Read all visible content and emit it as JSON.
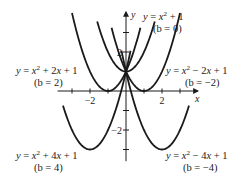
{
  "chart_data": {
    "type": "line",
    "title": "",
    "xlabel": "x",
    "ylabel": "y",
    "xlim": [
      -4,
      4
    ],
    "ylim": [
      -3.6,
      4.1
    ],
    "x_ticks": [
      -3,
      -2,
      -1,
      1,
      2,
      3
    ],
    "x_tick_labels": [
      {
        "value": -2,
        "text": "−2"
      },
      {
        "value": 2,
        "text": "2"
      }
    ],
    "y_ticks": [
      -3,
      -2,
      -1,
      1,
      2,
      3
    ],
    "y_tick_labels": [
      {
        "value": 2,
        "text": "2"
      },
      {
        "value": -2,
        "text": "−2"
      }
    ],
    "grid": false,
    "family": "y = x^2 + bx + 1",
    "series": [
      {
        "name": "y = x² + 1",
        "b": 0,
        "formula": "y = x^2 + 1",
        "label": "y = x² + 1",
        "sublabel": "(b = 0)",
        "vertex": [
          0,
          1
        ],
        "x_range": [
          -1.6,
          1.6
        ]
      },
      {
        "name": "y = x² + 2x + 1",
        "b": 2,
        "formula": "y = x^2 + 2x + 1",
        "label": "y = x² + 2x + 1",
        "sublabel": "(b = 2)",
        "vertex": [
          -1,
          0
        ],
        "x_range": [
          -3.0,
          0.8
        ]
      },
      {
        "name": "y = x² − 2x + 1",
        "b": -2,
        "formula": "y = x^2 - 2x + 1",
        "label": "y = x² − 2x + 1",
        "sublabel": "(b = −2)",
        "vertex": [
          1,
          0
        ],
        "x_range": [
          -0.8,
          3.0
        ]
      },
      {
        "name": "y = x² + 4x + 1",
        "b": 4,
        "formula": "y = x^2 + 4x + 1",
        "label": "y = x² + 4x + 1",
        "sublabel": "(b = 4)",
        "vertex": [
          -2,
          -3
        ],
        "x_range": [
          -3.5,
          0.25
        ]
      },
      {
        "name": "y = x² − 4x + 1",
        "b": -4,
        "formula": "y = x^2 - 4x + 1",
        "label": "y = x² − 4x + 1",
        "sublabel": "(b = −4)",
        "vertex": [
          2,
          -3
        ],
        "x_range": [
          -0.25,
          3.5
        ]
      }
    ]
  },
  "labels": {
    "x_axis": "x",
    "y_axis": "y",
    "b0_eq": "y = x² + 1",
    "b0_b": "(b = 0)",
    "b2_eq": "y = x² + 2x + 1",
    "b2_b": "(b = 2)",
    "bm2_eq": "y = x² − 2x + 1",
    "bm2_b": "(b = −2)",
    "b4_eq": "y = x² + 4x + 1",
    "b4_b": "(b = 4)",
    "bm4_eq": "y = x² − 4x + 1",
    "bm4_b": "(b = −4)"
  }
}
